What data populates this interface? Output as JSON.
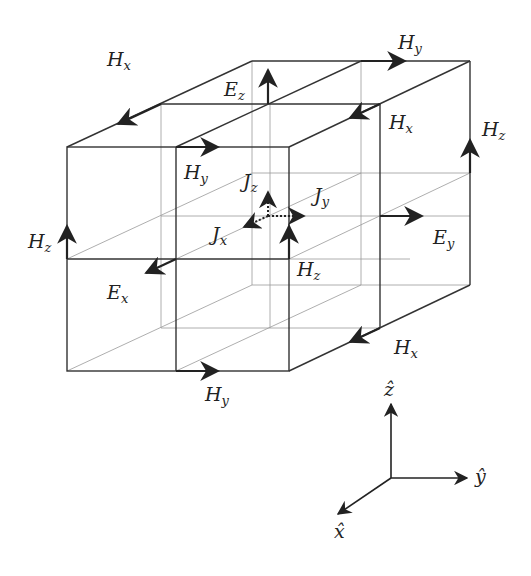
{
  "colors": {
    "line": "#333333",
    "thin": "#888888",
    "text": "#222222"
  },
  "labels": {
    "hx_top_left": {
      "main": "H",
      "sub": "x"
    },
    "ez_top": {
      "main": "E",
      "sub": "z"
    },
    "hy_top_right": {
      "main": "H",
      "sub": "y"
    },
    "hx_right_upper": {
      "main": "H",
      "sub": "x"
    },
    "hz_right": {
      "main": "H",
      "sub": "z"
    },
    "hy_front_upper": {
      "main": "H",
      "sub": "y"
    },
    "jz": {
      "main": "J",
      "sub": "z"
    },
    "jy": {
      "main": "J",
      "sub": "y"
    },
    "jx": {
      "main": "J",
      "sub": "x"
    },
    "hz_left": {
      "main": "H",
      "sub": "z"
    },
    "ey": {
      "main": "E",
      "sub": "y"
    },
    "ex": {
      "main": "E",
      "sub": "x"
    },
    "hz_center": {
      "main": "H",
      "sub": "z"
    },
    "hx_bottom_right": {
      "main": "H",
      "sub": "x"
    },
    "hy_bottom": {
      "main": "H",
      "sub": "y"
    }
  },
  "axes": {
    "z": "ẑ",
    "y": "ŷ",
    "x": "x̂"
  }
}
